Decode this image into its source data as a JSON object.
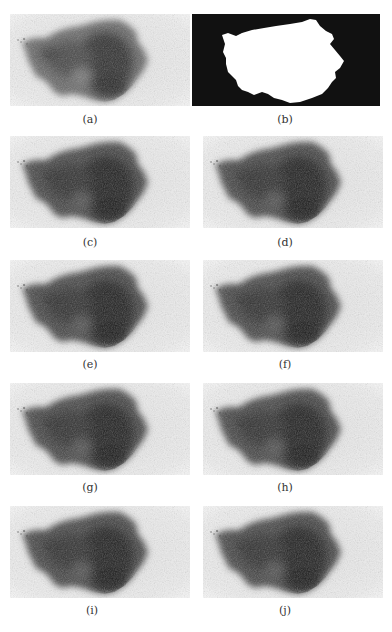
{
  "figure": {
    "panels": [
      {
        "id": "a",
        "label": "(a)",
        "kind": "dermoscopy-image",
        "col": 0,
        "row": 0
      },
      {
        "id": "b",
        "label": "(b)",
        "kind": "binary-mask",
        "col": 1,
        "row": 0
      },
      {
        "id": "c",
        "label": "(c)",
        "kind": "dermoscopy-image",
        "col": 0,
        "row": 1
      },
      {
        "id": "d",
        "label": "(d)",
        "kind": "dermoscopy-image",
        "col": 1,
        "row": 1
      },
      {
        "id": "e",
        "label": "(e)",
        "kind": "dermoscopy-image",
        "col": 0,
        "row": 2
      },
      {
        "id": "f",
        "label": "(f)",
        "kind": "dermoscopy-image",
        "col": 1,
        "row": 2
      },
      {
        "id": "g",
        "label": "(g)",
        "kind": "dermoscopy-image",
        "col": 0,
        "row": 3
      },
      {
        "id": "h",
        "label": "(h)",
        "kind": "dermoscopy-image",
        "col": 1,
        "row": 3
      },
      {
        "id": "i",
        "label": "(i)",
        "kind": "dermoscopy-image",
        "col": 0,
        "row": 4
      },
      {
        "id": "j",
        "label": "(j)",
        "kind": "dermoscopy-image",
        "col": 1,
        "row": 4
      }
    ],
    "colors": {
      "skin_background": "#ececec",
      "lesion_dark": "#2a2a2a",
      "lesion_mid": "#555555",
      "mask_background": "#111111",
      "mask_foreground": "#ffffff",
      "caption_text": "#333333"
    }
  }
}
